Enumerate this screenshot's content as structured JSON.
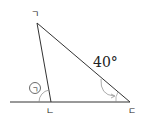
{
  "diagram": {
    "type": "triangle-exterior-angle",
    "vertices": [
      {
        "label": "ㄱ",
        "x": 37,
        "y": 23
      },
      {
        "label": "ㄴ",
        "x": 51,
        "y": 102
      },
      {
        "label": "ㄷ",
        "x": 130,
        "y": 102
      }
    ],
    "baseline": {
      "x1": 10,
      "x2": 130,
      "y": 102
    },
    "angle_at_c": {
      "label": "40°",
      "value": 40
    },
    "unknown_angle": {
      "label": "㉠",
      "at": "ㄴ",
      "kind": "exterior"
    },
    "line_color": "#333333"
  }
}
